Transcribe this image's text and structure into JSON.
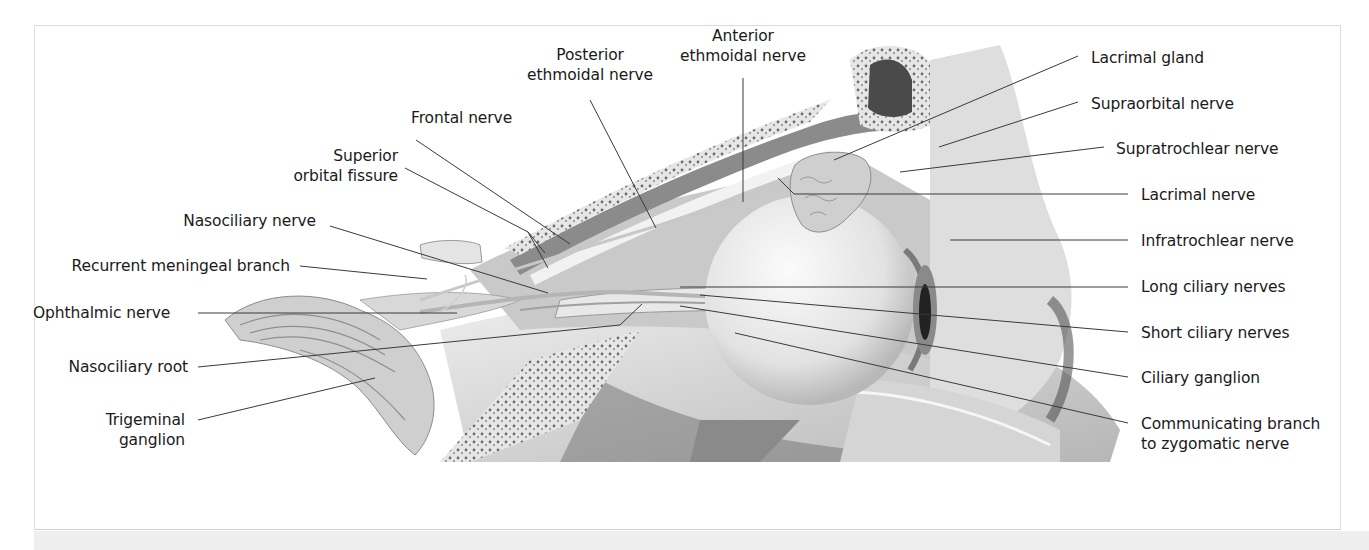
{
  "figure": {
    "caption_visible": "",
    "labels_left": [
      {
        "id": "frontal-nerve",
        "lines": [
          "Frontal nerve"
        ]
      },
      {
        "id": "superior-orbital-fissure",
        "lines": [
          "Superior",
          "orbital fissure"
        ]
      },
      {
        "id": "nasociliary-nerve",
        "lines": [
          "Nasociliary nerve"
        ]
      },
      {
        "id": "recurrent-meningeal-branch",
        "lines": [
          "Recurrent meningeal branch"
        ]
      },
      {
        "id": "ophthalmic-nerve",
        "lines": [
          "Ophthalmic nerve"
        ]
      },
      {
        "id": "nasociliary-root",
        "lines": [
          "Nasociliary root"
        ]
      },
      {
        "id": "trigeminal-ganglion",
        "lines": [
          "Trigeminal",
          "ganglion"
        ]
      }
    ],
    "labels_top": [
      {
        "id": "posterior-ethmoidal-nerve",
        "lines": [
          "Posterior",
          "ethmoidal nerve"
        ]
      },
      {
        "id": "anterior-ethmoidal-nerve",
        "lines": [
          "Anterior",
          "ethmoidal nerve"
        ]
      }
    ],
    "labels_right": [
      {
        "id": "lacrimal-gland",
        "lines": [
          "Lacrimal gland"
        ]
      },
      {
        "id": "supraorbital-nerve",
        "lines": [
          "Supraorbital nerve"
        ]
      },
      {
        "id": "supratrochlear-nerve",
        "lines": [
          "Supratrochlear nerve"
        ]
      },
      {
        "id": "lacrimal-nerve",
        "lines": [
          "Lacrimal nerve"
        ]
      },
      {
        "id": "infratrochlear-nerve",
        "lines": [
          "Infratrochlear nerve"
        ]
      },
      {
        "id": "long-ciliary-nerves",
        "lines": [
          "Long ciliary nerves"
        ]
      },
      {
        "id": "short-ciliary-nerves",
        "lines": [
          "Short ciliary nerves"
        ]
      },
      {
        "id": "ciliary-ganglion",
        "lines": [
          "Ciliary ganglion"
        ]
      },
      {
        "id": "communicating-branch",
        "lines": [
          "Communicating branch",
          "to zygomatic nerve"
        ]
      }
    ],
    "colors": {
      "text": "#1a1a1a",
      "leader": "#3a3a3a",
      "panel_border": "#dcdcdc",
      "caption_bar": "#eeeeee"
    }
  }
}
